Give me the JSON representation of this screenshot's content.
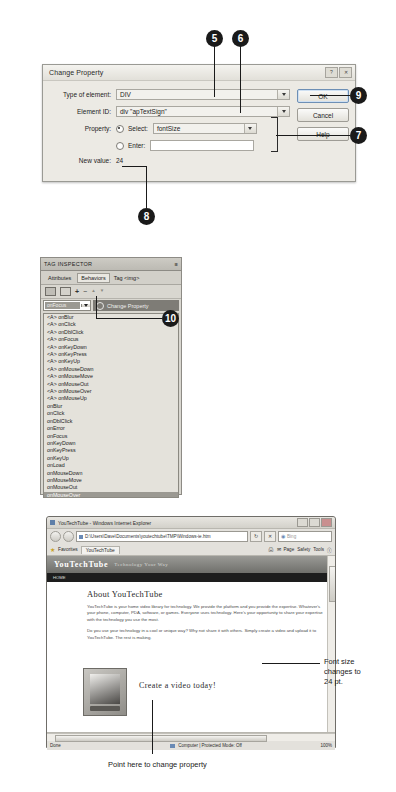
{
  "dialog": {
    "title": "Change Property",
    "window_buttons": [
      "?",
      "✕"
    ],
    "fields": {
      "type_label": "Type of element:",
      "type_value": "DIV",
      "id_label": "Element ID:",
      "id_value": "div \"apTextSign\"",
      "property_label": "Property:",
      "select_radio_label": "Select:",
      "select_value": "fontSize",
      "enter_radio_label": "Enter:",
      "enter_value": "",
      "newvalue_label": "New value:",
      "newvalue_value": "24"
    },
    "buttons": {
      "ok": "OK",
      "cancel": "Cancel",
      "help": "Help"
    }
  },
  "tag_inspector": {
    "panel_title": "TAG INSPECTOR",
    "menu_glyph": "≡",
    "tabs": [
      "Attributes",
      "Behaviors"
    ],
    "active_tab": "Behaviors",
    "tag_label": "Tag <img>",
    "toolbar_icons": [
      "show-set-events-icon",
      "show-all-events-icon",
      "add-behavior-icon",
      "remove-behavior-icon",
      "move-up-icon",
      "move-down-icon"
    ],
    "toolbar_glyphs": [
      "+",
      "−",
      "▲",
      "▼"
    ],
    "event_selected": "onFocus",
    "action_name": "Change Property",
    "events": [
      {
        "label": "<A> onBlur",
        "selected": false
      },
      {
        "label": "<A> onClick",
        "selected": false
      },
      {
        "label": "<A> onDblClick",
        "selected": false
      },
      {
        "label": "<A> onFocus",
        "selected": false
      },
      {
        "label": "<A> onKeyDown",
        "selected": false
      },
      {
        "label": "<A> onKeyPress",
        "selected": false
      },
      {
        "label": "<A> onKeyUp",
        "selected": false
      },
      {
        "label": "<A> onMouseDown",
        "selected": false
      },
      {
        "label": "<A> onMouseMove",
        "selected": false
      },
      {
        "label": "<A> onMouseOut",
        "selected": false
      },
      {
        "label": "<A> onMouseOver",
        "selected": false
      },
      {
        "label": "<A> onMouseUp",
        "selected": false
      },
      {
        "label": "onBlur",
        "selected": false
      },
      {
        "label": "onClick",
        "selected": false
      },
      {
        "label": "onDblClick",
        "selected": false
      },
      {
        "label": "onError",
        "selected": false
      },
      {
        "label": "onFocus",
        "selected": false
      },
      {
        "label": "onKeyDown",
        "selected": false
      },
      {
        "label": "onKeyPress",
        "selected": false
      },
      {
        "label": "onKeyUp",
        "selected": false
      },
      {
        "label": "onLoad",
        "selected": false
      },
      {
        "label": "onMouseDown",
        "selected": false
      },
      {
        "label": "onMouseMove",
        "selected": false
      },
      {
        "label": "onMouseOut",
        "selected": false
      },
      {
        "label": "onMouseOver",
        "selected": true
      },
      {
        "label": "onMouseUp",
        "selected": false
      }
    ]
  },
  "browser": {
    "title": "YouTechTube - Windows Internet Explorer",
    "window_buttons": [
      "–",
      "❐",
      "✕"
    ],
    "address": "D:\\Users\\Dave\\Documents\\youtechtube\\TMP\\Windows-ie.htm",
    "search_placeholder": "Bing",
    "favorites_label": "Favorites",
    "tab_label": "YouTechTube",
    "command_bar": [
      "Page",
      "Safety",
      "Tools"
    ],
    "page": {
      "site_name": "YouTechTube",
      "site_tagline": "Technology Your Way",
      "nav_item": "HOME",
      "heading": "About YouTechTube",
      "paragraph1": "YouTechTube is your home video library for technology. We provide the platform and you provide the expertise. Whatever's your phone, computer, PDA, software, or games. Everyone uses technology. Here's your opportunity to share your expertise with the technology you use the most.",
      "paragraph2": "Do you use your technology in a cool or unique way? Why not share it with others. Simply create a video and upload it to YouTechTube. The rest is making.",
      "cta": "Create a video today!"
    },
    "status": {
      "left": "Done",
      "middle": "Computer | Protected Mode: Off",
      "zoom": "100%"
    }
  },
  "callouts": [
    {
      "number": "5"
    },
    {
      "number": "6"
    },
    {
      "number": "7"
    },
    {
      "number": "8"
    },
    {
      "number": "9"
    },
    {
      "number": "10"
    }
  ],
  "annotations": {
    "font_size_note": "Font size\nchanges to\n24 pt.",
    "point_here_note": "Point here to change property"
  }
}
